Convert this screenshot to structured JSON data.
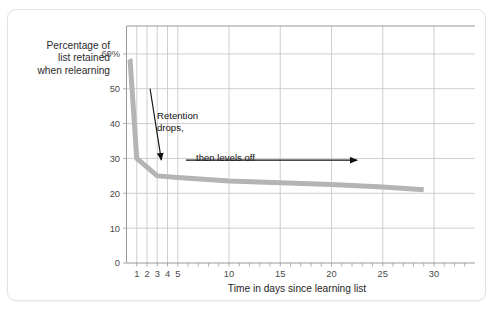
{
  "card": {
    "top_fragment": ""
  },
  "labels": {
    "y_axis_line1": "Percentage of",
    "y_axis_line2": "list retained",
    "y_axis_line3": "when relearning",
    "x_axis_title": "Time in days since learning list"
  },
  "annotations": {
    "retention_line1": "Retention",
    "retention_line2": "drops,",
    "levels_off": "then levels off"
  },
  "colors": {
    "curve": "#b4b4b4",
    "grid": "#c9c9c9",
    "axis": "#9a9a9a",
    "text": "#2b2b2b",
    "annotation": "#111111",
    "card_border": "#e3e3e6",
    "background": "#ffffff"
  },
  "chart_data": {
    "type": "line",
    "title": "",
    "subtitle": "",
    "xlabel": "Time in days since learning list",
    "ylabel": "Percentage of list retained when relearning",
    "xlim": [
      0,
      34
    ],
    "ylim": [
      0,
      68
    ],
    "grid": true,
    "legend": "none",
    "x_ticks": [
      1,
      2,
      3,
      4,
      5,
      10,
      15,
      20,
      25,
      30
    ],
    "x_tick_labels": [
      "1",
      "2",
      "3",
      "4",
      "5",
      "10",
      "15",
      "20",
      "25",
      "30"
    ],
    "x_minor_ticks": [
      1,
      2,
      3,
      4,
      5,
      6,
      7,
      8,
      9,
      10,
      11,
      12,
      13,
      14,
      15,
      16,
      17,
      18,
      19,
      20,
      21,
      22,
      23,
      24,
      25,
      26,
      27,
      28,
      29,
      30,
      31,
      32,
      33
    ],
    "y_ticks": [
      0,
      10,
      20,
      30,
      40,
      50,
      60
    ],
    "y_tick_labels": [
      "0",
      "10",
      "20",
      "30",
      "40",
      "50",
      "60%"
    ],
    "y_gridlines": [
      10,
      20,
      30,
      40,
      50,
      60
    ],
    "x_gridlines": [
      1,
      2,
      3,
      4,
      5,
      10,
      15,
      20,
      25,
      30
    ],
    "series": [
      {
        "name": "Retention (savings)",
        "color": "#b4b4b4",
        "line_width": 5,
        "x": [
          0.3,
          0.35,
          1,
          3,
          5,
          10,
          15,
          20,
          25,
          29
        ],
        "y": [
          58.5,
          58.2,
          30,
          25,
          24.5,
          23.5,
          23,
          22.5,
          21.8,
          21
        ]
      }
    ],
    "annotations": [
      {
        "text": "Retention drops,",
        "type": "arrow",
        "text_x": 3.6,
        "text_y": 45,
        "arrow_from": [
          2.3,
          50
        ],
        "arrow_to": [
          3.4,
          29.5
        ]
      },
      {
        "text": "then levels off",
        "type": "arrow",
        "text_x": 7.5,
        "text_y": 32,
        "arrow_from": [
          5.8,
          29.5
        ],
        "arrow_to": [
          22.5,
          29.5
        ]
      }
    ]
  }
}
